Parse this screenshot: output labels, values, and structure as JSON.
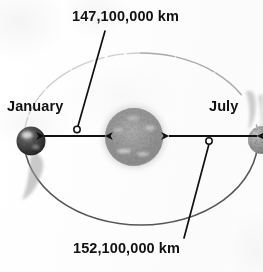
{
  "figure": {
    "background_color": "#fdfdfd",
    "ink_color": "#111111",
    "width": 263,
    "height": 272
  },
  "labels": {
    "perihelion_distance": "147,100,000 km",
    "aphelion_distance": "152,100,000 km",
    "january_position": "January",
    "july_position": "July"
  },
  "bodies": {
    "sun": {
      "name": "Sun",
      "cx": 134,
      "cy": 137,
      "r": 29,
      "color": "#9a9a9a"
    },
    "earth_january": {
      "name": "Earth in January",
      "cx": 31,
      "cy": 141,
      "r": 14,
      "color": "#4e4e4e"
    },
    "earth_july": {
      "name": "Earth in July",
      "cx": 262,
      "cy": 140,
      "r": 14,
      "color": "#9e9e9e"
    }
  },
  "orbit": {
    "name": "orbit-ellipse",
    "cx": 141,
    "cy": 139,
    "rx": 117,
    "ry": 86,
    "stroke_dark": "#5a5a5a",
    "stroke_light": "#c8c8c8"
  },
  "measurements": [
    {
      "name": "perihelion-arrow",
      "label": "147,100,000 km",
      "from_x": 43,
      "to_x": 106,
      "y": 136,
      "marker_x": 77,
      "marker_y": 129
    },
    {
      "name": "aphelion-arrow",
      "label": "152,100,000 km",
      "from_x": 168,
      "to_x": 258,
      "y": 136,
      "marker_x": 209,
      "marker_y": 141
    }
  ],
  "leader_lines": [
    {
      "name": "leader-top",
      "x1": 105,
      "y1": 31,
      "x2": 77,
      "y2": 127
    },
    {
      "name": "leader-bottom",
      "x1": 209,
      "y1": 143,
      "x2": 184,
      "y2": 238
    }
  ]
}
